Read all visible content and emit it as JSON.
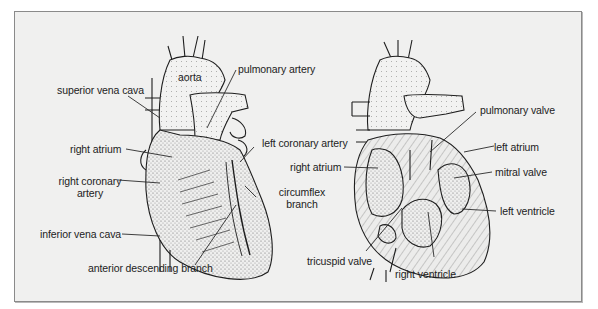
{
  "figure": {
    "panels": [
      {
        "name": "exterior-view",
        "labels": [
          {
            "id": "aorta",
            "text": "aorta"
          },
          {
            "id": "pulmonary_artery",
            "text": "pulmonary artery"
          },
          {
            "id": "superior_vena_cava",
            "text": "superior vena cava"
          },
          {
            "id": "right_atrium",
            "text": "right atrium"
          },
          {
            "id": "left_coronary_artery",
            "text": "left coronary artery"
          },
          {
            "id": "right_coronary_artery_1",
            "text": "right coronary"
          },
          {
            "id": "right_coronary_artery_2",
            "text": "artery"
          },
          {
            "id": "circumflex_branch_1",
            "text": "circumflex"
          },
          {
            "id": "circumflex_branch_2",
            "text": "branch"
          },
          {
            "id": "inferior_vena_cava",
            "text": "inferior vena cava"
          },
          {
            "id": "anterior_descending_branch",
            "text": "anterior descending branch"
          }
        ]
      },
      {
        "name": "interior-view",
        "labels": [
          {
            "id": "pulmonary_valve",
            "text": "pulmonary valve"
          },
          {
            "id": "left_atrium",
            "text": "left atrium"
          },
          {
            "id": "right_atrium",
            "text": "right atrium"
          },
          {
            "id": "mitral_valve",
            "text": "mitral valve"
          },
          {
            "id": "left_ventricle",
            "text": "left ventricle"
          },
          {
            "id": "tricuspid_valve",
            "text": "tricuspid valve"
          },
          {
            "id": "right_ventricle",
            "text": "right ventricle"
          }
        ]
      }
    ],
    "caption": ""
  }
}
